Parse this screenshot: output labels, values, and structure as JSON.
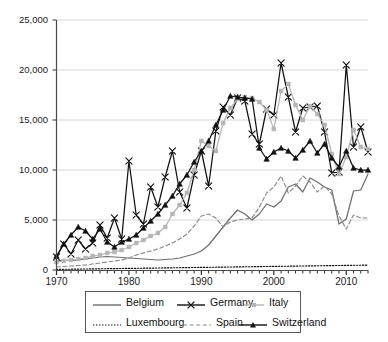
{
  "chart_data": {
    "type": "line",
    "title": "",
    "xlabel": "",
    "ylabel": "",
    "xlim": [
      1970,
      2013
    ],
    "ylim": [
      0,
      25000
    ],
    "grid": "horizontal",
    "legend_position": "bottom",
    "y_ticks": [
      0,
      5000,
      10000,
      15000,
      20000,
      25000
    ],
    "y_tick_labels": [
      "0",
      "5,000",
      "10,000",
      "15,000",
      "20,000",
      "25,000"
    ],
    "x_ticks": [
      1970,
      1980,
      1990,
      2000,
      2010
    ],
    "x_tick_labels": [
      "1970",
      "1980",
      "1990",
      "2000",
      "2010"
    ],
    "x_minor_tick_interval": 1,
    "x": [
      1970,
      1971,
      1972,
      1973,
      1974,
      1975,
      1976,
      1977,
      1978,
      1979,
      1980,
      1981,
      1982,
      1983,
      1984,
      1985,
      1986,
      1987,
      1988,
      1989,
      1990,
      1991,
      1992,
      1993,
      1994,
      1995,
      1996,
      1997,
      1998,
      1999,
      2000,
      2001,
      2002,
      2003,
      2004,
      2005,
      2006,
      2007,
      2008,
      2009,
      2010,
      2011,
      2012,
      2013
    ],
    "series": [
      {
        "name": "Belgium",
        "color": "#6e6e6e",
        "style": "solid",
        "marker": "none",
        "values": [
          900,
          1000,
          950,
          1000,
          1100,
          1200,
          1300,
          1350,
          1300,
          1250,
          1200,
          1150,
          1100,
          1050,
          1000,
          1050,
          1100,
          1200,
          1400,
          1600,
          1900,
          2500,
          3400,
          4300,
          5200,
          6000,
          5600,
          5000,
          5600,
          6600,
          6300,
          6900,
          8300,
          8600,
          7800,
          9200,
          8800,
          8300,
          8000,
          4600,
          5100,
          7900,
          8000,
          9600
        ]
      },
      {
        "name": "Germany",
        "color": "#111111",
        "style": "solid",
        "marker": "cross",
        "values": [
          1300,
          2600,
          1600,
          3000,
          2100,
          2700,
          4500,
          3200,
          5200,
          3100,
          10900,
          5500,
          4600,
          8300,
          6300,
          9300,
          11900,
          7800,
          6200,
          9500,
          11900,
          8400,
          13900,
          16300,
          15500,
          17200,
          16900,
          13600,
          12600,
          16100,
          15500,
          20700,
          17300,
          13800,
          16200,
          16300,
          16400,
          13800,
          9700,
          9800,
          20500,
          12300,
          14300,
          11800
        ]
      },
      {
        "name": "Italy",
        "color": "#b5b5b5",
        "style": "solid",
        "marker": "square",
        "values": [
          800,
          900,
          1000,
          1100,
          1200,
          1400,
          1500,
          1700,
          1800,
          2000,
          2300,
          2700,
          3000,
          3400,
          3700,
          4300,
          5600,
          6500,
          7700,
          10000,
          12900,
          12400,
          11900,
          14700,
          16200,
          17100,
          17300,
          17200,
          16800,
          16000,
          14100,
          17900,
          18600,
          16500,
          15000,
          16400,
          15600,
          14500,
          11600,
          9600,
          11300,
          14000,
          12300,
          12100
        ]
      },
      {
        "name": "Luxembourg",
        "color": "#111111",
        "style": "dotted",
        "marker": "none",
        "values": [
          60,
          70,
          80,
          90,
          100,
          110,
          120,
          130,
          140,
          150,
          160,
          170,
          180,
          190,
          200,
          210,
          220,
          230,
          240,
          250,
          260,
          270,
          280,
          290,
          300,
          310,
          320,
          330,
          340,
          350,
          360,
          370,
          380,
          390,
          400,
          410,
          420,
          430,
          440,
          450,
          460,
          470,
          480,
          490
        ]
      },
      {
        "name": "Spain",
        "color": "#8a8a8a",
        "style": "dashed",
        "marker": "none",
        "values": [
          300,
          350,
          400,
          450,
          500,
          600,
          700,
          800,
          900,
          1000,
          1200,
          1500,
          1700,
          1900,
          2100,
          2400,
          2700,
          3100,
          3600,
          4400,
          5400,
          5600,
          5200,
          4300,
          4800,
          5000,
          5100,
          5200,
          6300,
          7700,
          8300,
          9400,
          7700,
          8400,
          9400,
          8800,
          7800,
          8400,
          7600,
          5400,
          4100,
          5500,
          5200,
          5200
        ]
      },
      {
        "name": "Switzerland",
        "color": "#111111",
        "style": "solid",
        "marker": "triangle",
        "values": [
          1400,
          2600,
          3500,
          4300,
          3900,
          3100,
          4100,
          2800,
          2300,
          2800,
          3100,
          3500,
          4200,
          4900,
          5600,
          6500,
          7400,
          8600,
          9500,
          10800,
          11900,
          12900,
          14500,
          16000,
          17400,
          17300,
          17200,
          17100,
          12200,
          11100,
          11800,
          12200,
          11900,
          11200,
          12000,
          12900,
          11700,
          12600,
          11200,
          10300,
          11900,
          10200,
          10000,
          10000
        ]
      }
    ]
  },
  "axis": {
    "y_labels": [
      "25,000",
      "20,000",
      "15,000",
      "10,000",
      "5,000",
      "0"
    ],
    "x_labels": [
      "1970",
      "1980",
      "1990",
      "2000",
      "2010"
    ]
  },
  "legend": {
    "items": [
      {
        "label": "Belgium"
      },
      {
        "label": "Germany"
      },
      {
        "label": "Italy"
      },
      {
        "label": "Luxembourg"
      },
      {
        "label": "Spain"
      },
      {
        "label": "Switzerland"
      }
    ]
  }
}
